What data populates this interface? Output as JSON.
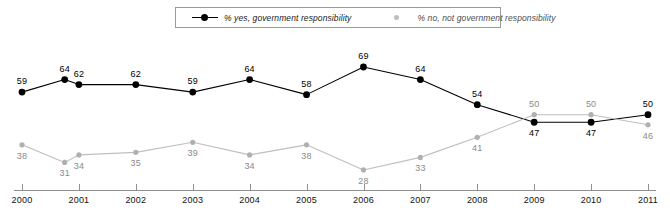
{
  "chart_data": {
    "type": "line",
    "title": "",
    "subtitle": "",
    "xlabel": "",
    "ylabel": "",
    "grid": false,
    "legend_position": "top-center",
    "ylim": [
      20,
      75
    ],
    "xlim": [
      2000,
      2011
    ],
    "categories": [
      "2000",
      "2001",
      "2002",
      "2003",
      "2004",
      "2005",
      "2006",
      "2007",
      "2008",
      "2009",
      "2010",
      "2011"
    ],
    "x_tick_labels": [
      "2000",
      "2001",
      "2002",
      "2003",
      "2004",
      "2005",
      "2006",
      "2007",
      "2008",
      "2009",
      "2010",
      "2011"
    ],
    "series": [
      {
        "name": "% yes, government responsibility",
        "color": "#000000",
        "marker": "filled-circle",
        "values": [
          59,
          64,
          62,
          62,
          59,
          64,
          58,
          69,
          64,
          54,
          47,
          47,
          50
        ],
        "x": [
          2000,
          2000.75,
          2001,
          2002,
          2003,
          2004,
          2005,
          2006,
          2007,
          2008,
          2009,
          2010,
          2011
        ],
        "point_labels": [
          "59",
          "64",
          "62",
          "62",
          "59",
          "64",
          "58",
          "69",
          "64",
          "54",
          "47",
          "47",
          "50"
        ],
        "label_positions": [
          "above",
          "above",
          "above",
          "above",
          "above",
          "above",
          "above",
          "above",
          "above",
          "above",
          "below",
          "below",
          "above"
        ]
      },
      {
        "name": "% no, not government responsibility",
        "color": "#bfbfbf",
        "marker": "filled-circle-small",
        "values": [
          38,
          31,
          34,
          35,
          39,
          34,
          38,
          28,
          33,
          41,
          50,
          50,
          46
        ],
        "x": [
          2000,
          2000.75,
          2001,
          2002,
          2003,
          2004,
          2005,
          2006,
          2007,
          2008,
          2009,
          2010,
          2011
        ],
        "point_labels": [
          "38",
          "31",
          "34",
          "35",
          "39",
          "34",
          "38",
          "28",
          "33",
          "41",
          "50",
          "50",
          "46"
        ],
        "label_positions": [
          "below",
          "below",
          "below",
          "below",
          "below",
          "below",
          "below",
          "below",
          "below",
          "below",
          "above",
          "above",
          "below"
        ]
      }
    ]
  },
  "legend": {
    "entries": [
      {
        "label": "% yes, government responsibility",
        "color": "#000000"
      },
      {
        "label": "% no, not government responsibility",
        "color": "#bfbfbf"
      }
    ]
  },
  "colors": {
    "series_yes": "#000000",
    "series_no": "#bfbfbf",
    "axis": "#8f8f8f",
    "legend_border": "#9a9a9a",
    "background": "#ffffff"
  }
}
